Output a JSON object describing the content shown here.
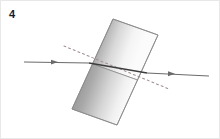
{
  "figure": {
    "label": "4",
    "type": "optics-ray-diagram",
    "canvas": {
      "width": 220,
      "height": 139
    },
    "background_color": "#ffffff",
    "border_color": "#e8e8e8"
  },
  "block": {
    "name": "glass-block",
    "shape": "parallelogram",
    "corners": {
      "top_left": [
        112,
        18
      ],
      "top_right": [
        157,
        34
      ],
      "bottom_right": [
        116,
        124
      ],
      "bottom_left": [
        71,
        108
      ]
    },
    "midline_left": [
      91.5,
      63
    ],
    "midline_right": [
      136.5,
      79
    ],
    "outline_color": "#8c8c8c",
    "gradient_dark": "#9a9a9a",
    "gradient_light": "#fbfbfb",
    "gradient_angle_deg": 21
  },
  "rays": {
    "incident": {
      "name": "incident-ray",
      "from": [
        23,
        61
      ],
      "to": [
        88,
        62
      ],
      "color": "#6b6b6b",
      "arrow_at": [
        55,
        61.2
      ],
      "style": "solid"
    },
    "internal": {
      "name": "refracted-ray-inside-block",
      "from": [
        88,
        62
      ],
      "to": [
        146,
        72
      ],
      "color": "#3d3d3d",
      "style": "solid"
    },
    "emergent": {
      "name": "emergent-ray",
      "from": [
        146,
        72
      ],
      "to": [
        208,
        75
      ],
      "color": "#6b6b6b",
      "arrow_at": [
        172,
        72.8
      ],
      "style": "solid"
    },
    "original_direction": {
      "name": "undeviated-path-dotted",
      "from": [
        63,
        45
      ],
      "to": [
        168,
        88
      ],
      "color": "#a08f8f",
      "style": "dotted",
      "dash_pattern": "2 3"
    }
  },
  "colors": {
    "ray_light": "#6b6b6b",
    "ray_dark": "#3d3d3d",
    "dotted": "#a08f8f",
    "label_text": "#1a1a1a"
  }
}
